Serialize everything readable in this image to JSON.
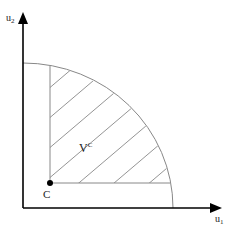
{
  "diagram": {
    "axes": {
      "x_label": "u",
      "x_subscript": "1",
      "y_label": "u",
      "y_subscript": "2"
    },
    "point": {
      "label": "C"
    },
    "region": {
      "label": "V",
      "superscript": "C",
      "fill": "hatched"
    },
    "colors": {
      "axis": "#000000",
      "lines": "#888888",
      "point": "#000000"
    }
  }
}
